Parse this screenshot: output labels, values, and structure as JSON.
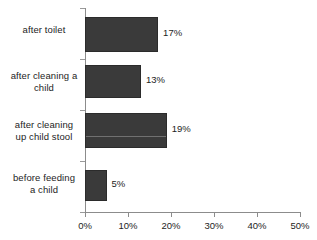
{
  "chart_data": {
    "type": "bar",
    "orientation": "horizontal",
    "title": "",
    "xlabel": "",
    "ylabel": "",
    "categories": [
      "after toilet",
      "after cleaning a child",
      "after cleaning up child stool",
      "before feeding a child"
    ],
    "category_lines": [
      [
        "after toilet"
      ],
      [
        "after cleaning a",
        "child"
      ],
      [
        "after cleaning",
        "up child stool"
      ],
      [
        "before feeding",
        "a child"
      ]
    ],
    "values": [
      17,
      13,
      19,
      5
    ],
    "value_labels": [
      "17%",
      "13%",
      "19%",
      "5%"
    ],
    "xlim": [
      0,
      50
    ],
    "xticks": [
      0,
      10,
      20,
      30,
      40,
      50
    ],
    "xtick_labels": [
      "0%",
      "10%",
      "20%",
      "30%",
      "40%",
      "50%"
    ],
    "grid": false,
    "legend": false,
    "bar_color": "#3a3a3a",
    "axis_color": "#8c8c8c",
    "text_color": "#1d1d1d",
    "background": "#ffffff"
  }
}
